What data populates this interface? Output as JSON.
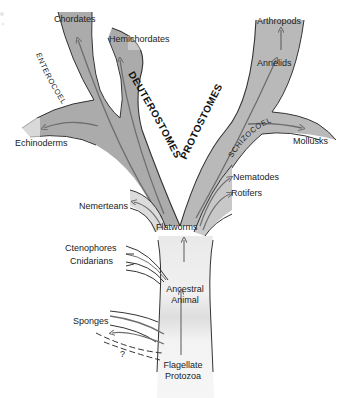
{
  "diagram": {
    "colors": {
      "branch_dark": "#a9a9a9",
      "branch_mid": "#bdbdbd",
      "branch_light": "#dcdcdc",
      "trunk_light": "#ececec",
      "outline": "#333333",
      "arrow": "#7a7a7a",
      "background": "#ffffff"
    },
    "clades": {
      "deuterostomes": "DEUTEROSTOMES",
      "protostomes": "PROTOSTOMES",
      "enterocoely": "ENTEROCOELY",
      "schizocoely": "SCHIZOCOELY"
    },
    "taxa": {
      "chordates": "Chordates",
      "hemichordates": "Hemichordates",
      "echinoderms": "Echinoderms",
      "arthropods": "Arthropods",
      "annelids": "Annelids",
      "mollusks": "Mollusks",
      "nematodes": "Nematodes",
      "rotifers": "Rotifers",
      "nemerteans": "Nemerteans",
      "flatworms": "Flatworms",
      "ctenophores": "Ctenophores",
      "cnidarians": "Cnidarians",
      "ancestral_animal_line1": "Ancestral",
      "ancestral_animal_line2": "Animal",
      "sponges": "Sponges",
      "unknown": "?",
      "flagellate_protozoa_line1": "Flagellate",
      "flagellate_protozoa_line2": "Protozoa"
    }
  }
}
